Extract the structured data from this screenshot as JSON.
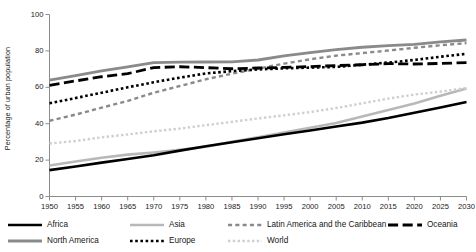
{
  "chart_data": {
    "type": "line",
    "title": "",
    "subtitle": "",
    "xlabel": "",
    "ylabel": "Percentage of urban population",
    "xlim": [
      1950,
      2030
    ],
    "ylim": [
      0,
      100
    ],
    "grid": false,
    "legend_position": "bottom",
    "x": [
      1950,
      1955,
      1960,
      1965,
      1970,
      1975,
      1980,
      1985,
      1990,
      1995,
      2000,
      2005,
      2010,
      2015,
      2020,
      2025,
      2030
    ],
    "xtick_labels": [
      "1950",
      "1955",
      "1960",
      "1965",
      "1970",
      "1975",
      "1980",
      "1985",
      "1990",
      "1995",
      "2000",
      "2005",
      "2010",
      "2015",
      "2020",
      "2025",
      "2030"
    ],
    "ytick_labels": [
      "0",
      "20",
      "40",
      "60",
      "80",
      "100"
    ],
    "ytick_values": [
      0,
      20,
      40,
      60,
      80,
      100
    ],
    "series": [
      {
        "name": "Africa",
        "color": "#000000",
        "style": "solid",
        "width": 2.6,
        "values": [
          14.5,
          16.5,
          18.6,
          20.6,
          22.7,
          25.2,
          27.6,
          29.8,
          32.0,
          34.2,
          36.3,
          38.5,
          40.6,
          43.1,
          46.0,
          48.9,
          51.9
        ]
      },
      {
        "name": "Asia",
        "color": "#b8b8b8",
        "style": "solid",
        "width": 2.6,
        "values": [
          17.0,
          19.2,
          21.3,
          23.0,
          24.2,
          25.6,
          27.3,
          30.0,
          32.6,
          35.2,
          37.8,
          40.4,
          44.0,
          47.5,
          51.1,
          55.3,
          59.3
        ]
      },
      {
        "name": "Latin America and the Caribbean",
        "color": "#8a8a8a",
        "style": "dashed",
        "width": 2.4,
        "values": [
          41.6,
          45.0,
          48.8,
          52.5,
          57.0,
          60.7,
          64.4,
          67.5,
          70.3,
          73.0,
          75.4,
          77.4,
          78.8,
          80.2,
          81.7,
          83.1,
          84.3
        ]
      },
      {
        "name": "Oceania",
        "color": "#000000",
        "style": "longdash",
        "width": 2.8,
        "values": [
          61.0,
          63.5,
          65.8,
          67.5,
          70.8,
          71.3,
          70.8,
          70.2,
          70.6,
          70.9,
          71.4,
          71.9,
          72.4,
          73.0,
          72.8,
          73.1,
          73.6
        ]
      },
      {
        "name": "North America",
        "color": "#8a8a8a",
        "style": "solid",
        "width": 2.8,
        "values": [
          63.9,
          66.4,
          69.0,
          71.2,
          73.6,
          73.8,
          73.9,
          74.0,
          75.0,
          77.3,
          79.1,
          80.7,
          82.0,
          82.9,
          83.6,
          84.9,
          86.0
        ]
      },
      {
        "name": "Europe",
        "color": "#000000",
        "style": "dotted",
        "width": 2.6,
        "values": [
          51.2,
          54.1,
          57.0,
          60.0,
          62.8,
          65.3,
          67.6,
          68.9,
          69.8,
          70.4,
          70.8,
          71.2,
          72.4,
          73.6,
          75.0,
          76.8,
          78.4
        ]
      },
      {
        "name": "World",
        "color": "#cfcfcf",
        "style": "dotted",
        "width": 2.4,
        "values": [
          29.1,
          30.5,
          32.5,
          34.1,
          35.8,
          37.3,
          39.2,
          41.0,
          42.9,
          44.6,
          46.4,
          48.6,
          51.2,
          53.8,
          56.0,
          57.6,
          59.6
        ]
      }
    ],
    "legend_rows": [
      [
        "Africa",
        "Asia",
        "Latin America and the Caribbean",
        "Oceania"
      ],
      [
        "North America",
        "Europe",
        "World"
      ]
    ]
  }
}
